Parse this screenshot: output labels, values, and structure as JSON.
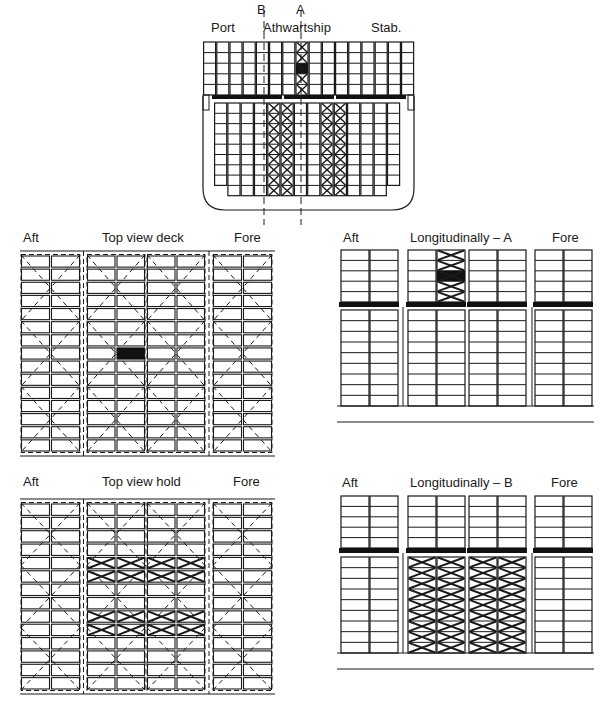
{
  "colors": {
    "ink": "#1a1a1a",
    "fill": "#111111",
    "bg": "#ffffff"
  },
  "section_view": {
    "labels": {
      "port": "Port",
      "athwartship": "Athwartship",
      "stab": "Stab.",
      "marker_a": "A",
      "marker_b": "B"
    },
    "deck": {
      "columns": 16,
      "rows": 5,
      "crossed_columns": [
        7
      ],
      "filled_cells": [
        [
          7,
          2
        ]
      ]
    },
    "hold": {
      "columns": 14,
      "rows": 9,
      "crossed_columns": [
        4,
        5,
        8,
        9
      ],
      "dash_dot_column": 6
    }
  },
  "top_view_deck": {
    "labels": {
      "left": "Aft",
      "title": "Top view deck",
      "right": "Fore"
    },
    "bays": 4,
    "columns_per_bay": 2,
    "rows": 15,
    "filled_cells": [
      [
        1,
        1,
        7
      ]
    ]
  },
  "longitudinal_a": {
    "labels": {
      "left": "Aft",
      "title": "Longitudinally – A",
      "right": "Fore"
    },
    "deck_rows": 5,
    "hold_rows": 9,
    "crossed_deck_columns": [
      3
    ],
    "filled_deck_cells": [
      [
        3,
        2
      ]
    ],
    "crossed_hold_columns": []
  },
  "top_view_hold": {
    "labels": {
      "left": "Aft",
      "title": "Top view hold",
      "right": "Fore"
    },
    "bays": 4,
    "columns_per_bay": 2,
    "rows": 14,
    "crossed_bays": [
      1,
      2
    ],
    "crossed_rows": [
      4,
      5,
      8,
      9
    ]
  },
  "longitudinal_b": {
    "labels": {
      "left": "Aft",
      "title": "Longitudinally – B",
      "right": "Fore"
    },
    "deck_rows": 5,
    "hold_rows": 9,
    "crossed_deck_columns": [],
    "filled_deck_cells": [],
    "crossed_hold_columns": [
      2,
      3,
      4,
      5
    ]
  }
}
